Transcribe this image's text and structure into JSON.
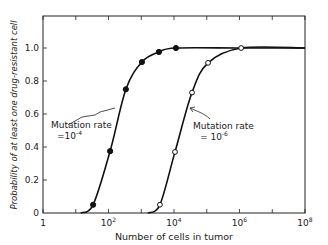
{
  "chart_data": {
    "type": "line",
    "title": "",
    "xlabel": "Number of cells in tumor",
    "ylabel": "Probability of at least one drug-resistant cell",
    "xscale": "log",
    "xlim": [
      1,
      100000000
    ],
    "ylim": [
      0,
      1.0
    ],
    "x_tick_labels": [
      {
        "base": "1",
        "exp": "",
        "log": 0
      },
      {
        "base": "10",
        "exp": "2",
        "log": 2
      },
      {
        "base": "10",
        "exp": "4",
        "log": 4
      },
      {
        "base": "10",
        "exp": "6",
        "log": 6
      },
      {
        "base": "10",
        "exp": "8",
        "log": 8
      }
    ],
    "x_minor_ticks_log": [
      0,
      1,
      2,
      3,
      4,
      5,
      6,
      7,
      8
    ],
    "y_ticks": [
      {
        "value": 0,
        "label": "0"
      },
      {
        "value": 0.2,
        "label": "0.2"
      },
      {
        "value": 0.4,
        "label": "0.4"
      },
      {
        "value": 0.6,
        "label": "0.6"
      },
      {
        "value": 0.8,
        "label": "0.8"
      },
      {
        "value": 1.0,
        "label": "1.0"
      }
    ],
    "grid": false,
    "legend": "none (inline annotations)",
    "series": [
      {
        "name": "Mutation rate = 10^-4",
        "marker": "filled-circle",
        "points_log10x": [
          1.53,
          2.05,
          2.53,
          3.02,
          3.54,
          4.06
        ],
        "x": [
          34,
          112,
          340,
          1050,
          3470,
          11500
        ],
        "y": [
          0.05,
          0.375,
          0.75,
          0.915,
          0.976,
          1.0
        ],
        "curve_log10x": [
          1.15,
          1.53,
          2.05,
          2.53,
          3.02,
          3.54,
          4.06,
          6.05,
          8.0
        ],
        "curve_y": [
          0.0,
          0.05,
          0.375,
          0.75,
          0.915,
          0.976,
          1.0,
          1.0,
          1.0
        ]
      },
      {
        "name": "Mutation rate = 10^-6",
        "marker": "open-circle",
        "points_log10x": [
          3.57,
          4.03,
          4.55,
          5.04,
          6.05
        ],
        "x": [
          3700,
          10700,
          35500,
          110000,
          1120000
        ],
        "y": [
          0.05,
          0.37,
          0.73,
          0.91,
          1.0
        ],
        "curve_log10x": [
          3.2,
          3.57,
          4.03,
          4.55,
          5.04,
          6.05,
          8.0
        ],
        "curve_y": [
          0.0,
          0.05,
          0.37,
          0.73,
          0.91,
          1.0,
          1.0
        ]
      }
    ],
    "annotations": [
      {
        "line1": "Mutation rate",
        "line2_prefix": "=10",
        "line2_exp": "-4",
        "target": "series-0"
      },
      {
        "line1": "Mutation rate",
        "line2_prefix": "= 10",
        "line2_exp": "-6",
        "target": "series-1"
      }
    ]
  }
}
